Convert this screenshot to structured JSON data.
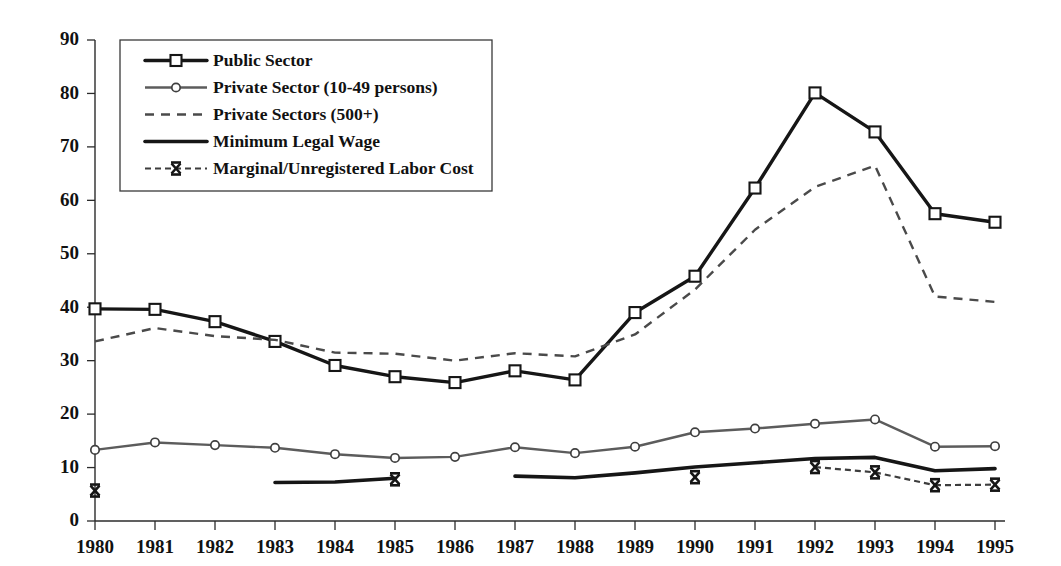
{
  "chart_data": {
    "type": "line",
    "title": "",
    "subtitle": "",
    "xlabel": "",
    "ylabel": "",
    "categories": [
      "1980",
      "1981",
      "1982",
      "1983",
      "1984",
      "1985",
      "1986",
      "1987",
      "1988",
      "1989",
      "1990",
      "1991",
      "1992",
      "1993",
      "1994",
      "1995"
    ],
    "x": [
      1980,
      1981,
      1982,
      1983,
      1984,
      1985,
      1986,
      1987,
      1988,
      1989,
      1990,
      1991,
      1992,
      1993,
      1994,
      1995
    ],
    "xlim": [
      1980,
      1995
    ],
    "ylim": [
      0,
      90
    ],
    "ytick_labels": [
      "0",
      "10",
      "20",
      "30",
      "40",
      "50",
      "60",
      "70",
      "80",
      "90"
    ],
    "yticks": [
      0,
      10,
      20,
      30,
      40,
      50,
      60,
      70,
      80,
      90
    ],
    "grid": false,
    "legend_position": "top-left",
    "series": [
      {
        "name": "Public Sector",
        "marker": "square",
        "style": "solid-thick",
        "values": [
          39.7,
          39.6,
          37.3,
          33.6,
          29.1,
          27.0,
          25.9,
          28.1,
          26.4,
          39.0,
          45.8,
          62.3,
          80.1,
          72.8,
          57.5,
          55.9
        ]
      },
      {
        "name": "Private Sector (10-49 persons)",
        "marker": "diamond",
        "style": "solid-thin",
        "values": [
          13.3,
          14.7,
          14.2,
          13.7,
          12.5,
          11.8,
          12.0,
          13.8,
          12.7,
          13.9,
          16.6,
          17.3,
          18.2,
          19.0,
          13.9,
          14.0
        ]
      },
      {
        "name": "Private Sectors (500+)",
        "marker": "none",
        "style": "dashed",
        "values": [
          33.6,
          36.1,
          34.6,
          33.9,
          31.5,
          31.3,
          30.0,
          31.4,
          30.8,
          34.9,
          43.3,
          54.5,
          62.5,
          66.5,
          42.0,
          41.0
        ]
      },
      {
        "name": "Minimum Legal Wage",
        "marker": "none",
        "style": "solid-thick-nomarker",
        "segments": [
          {
            "from": "1983",
            "to": "1985",
            "values": [
              7.2,
              7.3,
              8.0
            ]
          },
          {
            "from": "1987",
            "to": "1995",
            "values": [
              8.4,
              8.1,
              9.0,
              10.1,
              10.9,
              11.7,
              11.9,
              9.4,
              9.8
            ]
          }
        ]
      },
      {
        "name": "Marginal/Unregistered Labor Cost",
        "marker": "x",
        "style": "dashed-x",
        "points": [
          {
            "year": "1980",
            "value": 5.7
          },
          {
            "year": "1985",
            "value": 7.8
          },
          {
            "year": "1990",
            "value": 8.2
          },
          {
            "year": "1992",
            "value": 10.1
          },
          {
            "year": "1993",
            "value": 9.1
          },
          {
            "year": "1994",
            "value": 6.7
          },
          {
            "year": "1995",
            "value": 6.8
          }
        ],
        "segments": [
          {
            "from": "1992",
            "to": "1993",
            "values": [
              10.1,
              9.1
            ]
          },
          {
            "from": "1993",
            "to": "1994",
            "values": [
              9.1,
              6.7
            ]
          },
          {
            "from": "1994",
            "to": "1995",
            "values": [
              6.7,
              6.8
            ]
          }
        ]
      }
    ]
  },
  "legend": {
    "entries": [
      {
        "label": "Public Sector",
        "key": "public"
      },
      {
        "label": "Private Sector (10-49 persons)",
        "key": "private_small"
      },
      {
        "label": "Private Sectors (500+)",
        "key": "private_large"
      },
      {
        "label": "Minimum Legal Wage",
        "key": "minwage"
      },
      {
        "label": "Marginal/Unregistered Labor Cost",
        "key": "marginal"
      }
    ]
  },
  "colors": {
    "axis": "#2b2b2b",
    "public": "#161616",
    "private_small": "#5c5c5c",
    "private_large": "#4a4a4a",
    "minwage": "#161616",
    "marginal": "#3d3d3d",
    "background": "#ffffff"
  }
}
